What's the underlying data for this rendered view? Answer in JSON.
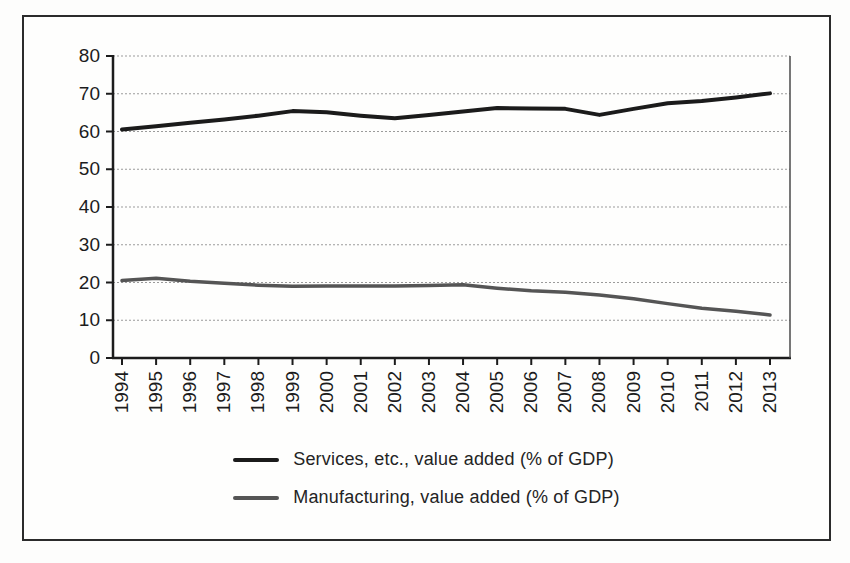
{
  "chart_data": {
    "type": "line",
    "title": "",
    "xlabel": "",
    "ylabel": "",
    "x": [
      1994,
      1995,
      1996,
      1997,
      1998,
      1999,
      2000,
      2001,
      2002,
      2003,
      2004,
      2005,
      2006,
      2007,
      2008,
      2009,
      2010,
      2011,
      2012,
      2013
    ],
    "series": [
      {
        "id": "services",
        "name": "Services, etc., value added (% of GDP)",
        "color": "#1b1b1b",
        "stroke_width": 4,
        "values": [
          60.5,
          61.4,
          62.3,
          63.2,
          64.2,
          65.4,
          65.1,
          64.2,
          63.5,
          64.4,
          65.3,
          66.2,
          66.1,
          66.0,
          64.4,
          66.0,
          67.5,
          68.1,
          69.0,
          70.1
        ]
      },
      {
        "id": "manufacturing",
        "name": "Manufacturing, value added (% of GDP)",
        "color": "#555555",
        "stroke_width": 3.5,
        "values": [
          20.5,
          21.1,
          20.3,
          19.8,
          19.3,
          19.0,
          19.1,
          19.1,
          19.1,
          19.2,
          19.4,
          18.5,
          17.8,
          17.4,
          16.7,
          15.7,
          14.4,
          13.2,
          12.4,
          11.4
        ]
      }
    ],
    "ylim": [
      0,
      80
    ],
    "yticks": [
      0,
      10,
      20,
      30,
      40,
      50,
      60,
      70,
      80
    ],
    "grid": "horizontal dashed",
    "gridline_color": "#9b9b9b",
    "axis_color": "#1c1c1c",
    "legend_position": "bottom-center"
  }
}
